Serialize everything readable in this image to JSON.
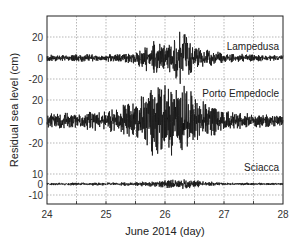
{
  "chart_data": {
    "type": "line",
    "title": "",
    "xlabel": "June 2014 (day)",
    "ylabel": "Residual sea level (cm)",
    "x_ticks": [
      "24",
      "25",
      "26",
      "27",
      "28"
    ],
    "xlim": [
      24,
      28
    ],
    "grid": true,
    "legend": "none (station names annotated at right of each trace)",
    "series": [
      {
        "name": "Lampedusa",
        "y_ticks": [
          "20",
          "0",
          "-20"
        ],
        "ylim": [
          -25,
          35
        ],
        "description": "Quiet (~±3 cm) until ~25.6, oscillation grows to peak ~+23 cm / -20 cm around 26.3, decays back to ~±3 cm by 27",
        "envelope": [
          {
            "x": 24.0,
            "amp": 3
          },
          {
            "x": 25.0,
            "amp": 3
          },
          {
            "x": 25.5,
            "amp": 5
          },
          {
            "x": 25.8,
            "amp": 14
          },
          {
            "x": 26.0,
            "amp": 10
          },
          {
            "x": 26.3,
            "amp": 23
          },
          {
            "x": 26.5,
            "amp": 9
          },
          {
            "x": 27.0,
            "amp": 4
          },
          {
            "x": 28.0,
            "amp": 2
          }
        ]
      },
      {
        "name": "Porto Empedocle",
        "y_ticks": [
          "20",
          "0",
          "-20"
        ],
        "ylim": [
          -30,
          25
        ],
        "description": "Background ~±6 cm, large seiche oscillations ~±30 cm between 25.5 and 26.5, peaking near 25.9-26.3, decaying to ~±5 cm by 27.5",
        "envelope": [
          {
            "x": 24.0,
            "amp": 6
          },
          {
            "x": 25.0,
            "amp": 8
          },
          {
            "x": 25.5,
            "amp": 16
          },
          {
            "x": 25.8,
            "amp": 30
          },
          {
            "x": 26.0,
            "amp": 28
          },
          {
            "x": 26.3,
            "amp": 30
          },
          {
            "x": 26.6,
            "amp": 18
          },
          {
            "x": 27.0,
            "amp": 8
          },
          {
            "x": 28.0,
            "amp": 4
          }
        ]
      },
      {
        "name": "Sciacca",
        "y_ticks": [
          "10",
          "0",
          "-10"
        ],
        "ylim": [
          -18,
          14
        ],
        "description": "Nearly flat, ~±2 cm, slight increase (~±4 cm) around 26.3",
        "envelope": [
          {
            "x": 24.0,
            "amp": 1
          },
          {
            "x": 25.5,
            "amp": 1.5
          },
          {
            "x": 26.3,
            "amp": 4
          },
          {
            "x": 27.0,
            "amp": 1
          },
          {
            "x": 28.0,
            "amp": 1
          }
        ]
      }
    ]
  }
}
